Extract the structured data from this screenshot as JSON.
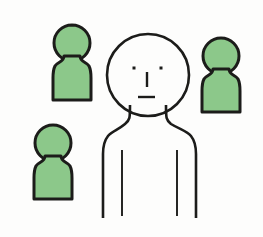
{
  "illustration": {
    "title": "Group of people figures",
    "description": "One large outlined person figure in the foreground with three smaller solid green person icons arranged around it",
    "canvas": {
      "width": 263,
      "height": 237,
      "background_color": "#fdfdfc"
    },
    "colors": {
      "background": "#fdfdfc",
      "figure_green": "#8cc88a",
      "outline_black": "#1c1c1a",
      "main_figure_fill": "#ffffff"
    },
    "stroke": {
      "main_figure_width": 2.6,
      "small_figure_width": 3.0,
      "arm_line_width": 1.9,
      "face_eye_size": 3.0,
      "face_nose_width": 2.4,
      "face_mouth_width": 2.4
    },
    "figures": [
      {
        "id": "main-figure",
        "role": "foreground-person",
        "style": "outline",
        "fill_color": "#ffffff",
        "stroke_color": "#1c1c1a",
        "has_face": true,
        "head": {
          "cx": 148,
          "cy": 75,
          "rx": 41,
          "ry": 41
        },
        "face": {
          "left_eye": {
            "x": 134,
            "y": 68
          },
          "right_eye": {
            "x": 161,
            "y": 68
          },
          "nose": {
            "x": 147,
            "y": 72,
            "length": 15
          },
          "mouth": {
            "x1": 138,
            "x2": 155,
            "y": 97
          }
        },
        "body_bottom_y": 218,
        "shoulder_left_x": 103,
        "shoulder_right_x": 196,
        "arm_lines": [
          {
            "x": 122,
            "y1": 150,
            "y2": 216
          },
          {
            "x": 177,
            "y1": 150,
            "y2": 216
          }
        ]
      },
      {
        "id": "small-figure-top-left",
        "role": "background-person",
        "style": "solid",
        "fill_color": "#8cc88a",
        "stroke_color": "#1c1c1a",
        "has_face": false,
        "head": {
          "cx": 72,
          "cy": 43,
          "rx": 18,
          "ry": 18
        },
        "body": {
          "left_x": 53,
          "right_x": 91,
          "top_y": 57,
          "bottom_y": 100
        }
      },
      {
        "id": "small-figure-right",
        "role": "background-person",
        "style": "solid",
        "fill_color": "#8cc88a",
        "stroke_color": "#1c1c1a",
        "has_face": false,
        "head": {
          "cx": 221,
          "cy": 56,
          "rx": 18,
          "ry": 18
        },
        "body": {
          "left_x": 202,
          "right_x": 240,
          "top_y": 70,
          "bottom_y": 112
        }
      },
      {
        "id": "small-figure-bottom-left",
        "role": "background-person",
        "style": "solid",
        "fill_color": "#8cc88a",
        "stroke_color": "#1c1c1a",
        "has_face": false,
        "head": {
          "cx": 53,
          "cy": 143,
          "rx": 18,
          "ry": 18
        },
        "body": {
          "left_x": 34,
          "right_x": 72,
          "top_y": 157,
          "bottom_y": 199
        }
      }
    ],
    "labels": {
      "main_figure": "large outlined person",
      "small_figure_top_left": "green person icon top left",
      "small_figure_right": "green person icon right",
      "small_figure_bottom_left": "green person icon bottom left"
    }
  }
}
